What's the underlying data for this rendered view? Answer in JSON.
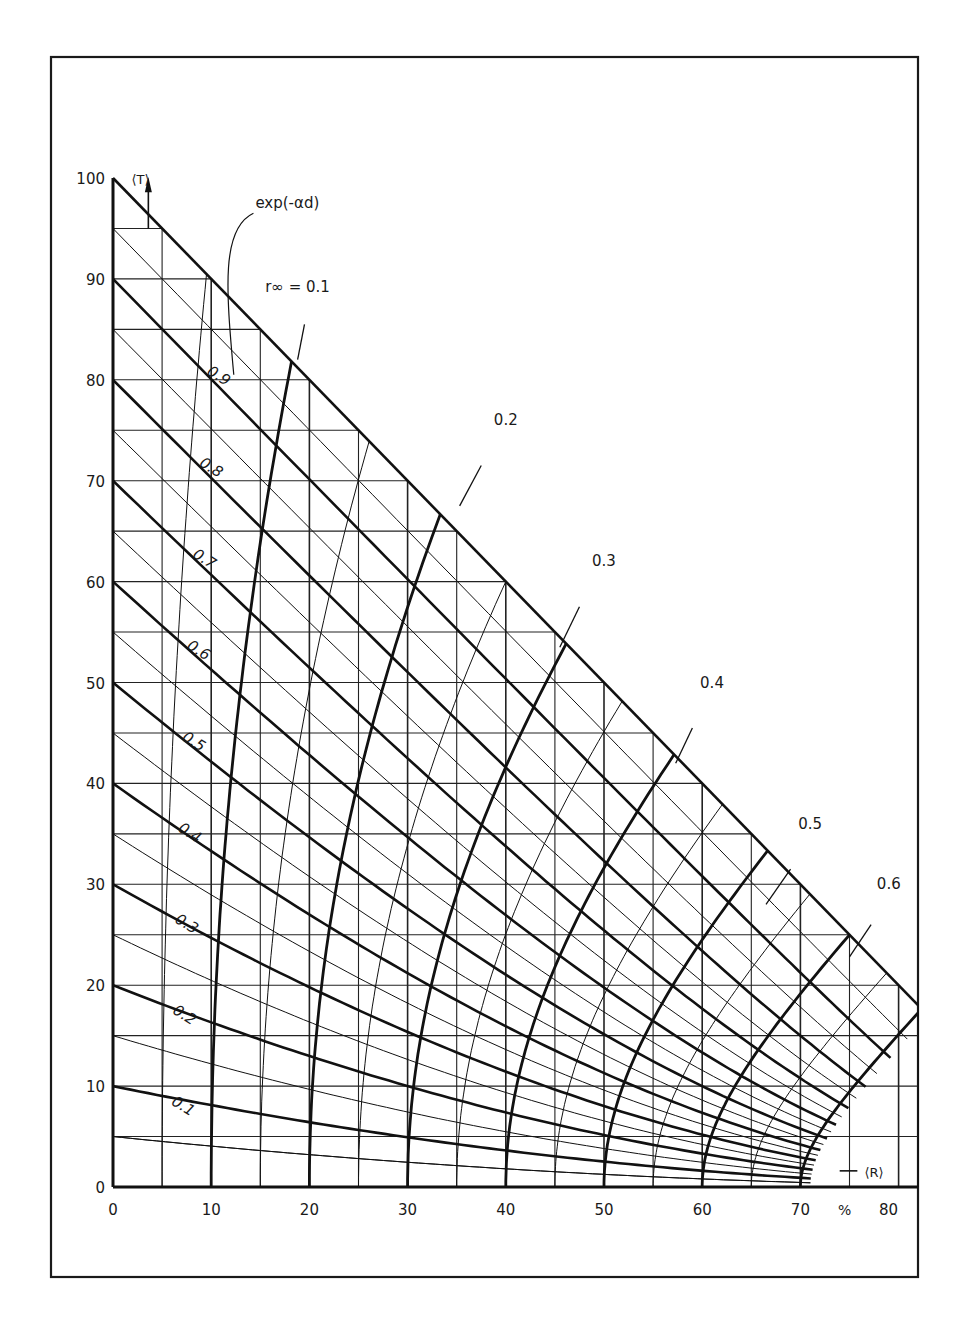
{
  "chart_data": {
    "type": "line",
    "title": "",
    "xlabel": "⟨R⟩",
    "ylabel": "⟨T⟩",
    "x_unit": "%",
    "xlim": [
      0,
      82
    ],
    "ylim": [
      0,
      100
    ],
    "x_ticks": [
      0,
      10,
      20,
      30,
      40,
      50,
      60,
      70,
      80
    ],
    "y_ticks": [
      0,
      10,
      20,
      30,
      40,
      50,
      60,
      70,
      80,
      90,
      100
    ],
    "grid": {
      "x_step": 5,
      "y_step": 5,
      "diagonal_step": 5
    },
    "family_1": {
      "name": "exp(-αd)",
      "bold_values": [
        0.1,
        0.2,
        0.3,
        0.4,
        0.5,
        0.6,
        0.7,
        0.8,
        0.9
      ],
      "thin_values": [
        0.05,
        0.15,
        0.25,
        0.35,
        0.45,
        0.55,
        0.65,
        0.75,
        0.85,
        0.95
      ],
      "labels": [
        "0.1",
        "0.2",
        "0.3",
        "0.4",
        "0.5",
        "0.6",
        "0.7",
        "0.8",
        "0.9"
      ]
    },
    "family_2": {
      "name": "r∞",
      "bold_values": [
        0.1,
        0.2,
        0.3,
        0.4,
        0.5,
        0.6,
        0.7
      ],
      "thin_values": [
        0.05,
        0.15,
        0.25,
        0.35,
        0.45,
        0.55,
        0.65
      ],
      "labels": [
        "r∞ = 0.1",
        "0.2",
        "0.3",
        "0.4",
        "0.5",
        "0.6"
      ]
    },
    "boundary": {
      "from": [
        0,
        100
      ],
      "to": [
        82,
        17
      ]
    },
    "annotations": [
      "exp(-αd)",
      "r∞ = 0.1",
      "0.2",
      "0.3",
      "0.4",
      "0.5",
      "0.6",
      "⟨T⟩",
      "⟨R⟩",
      "%"
    ]
  },
  "labels": {
    "exp_label": "exp(-αd)",
    "r_label": "r∞ = 0.1",
    "t_axis": "⟨T⟩",
    "r_axis": "⟨R⟩",
    "unit": "%"
  }
}
